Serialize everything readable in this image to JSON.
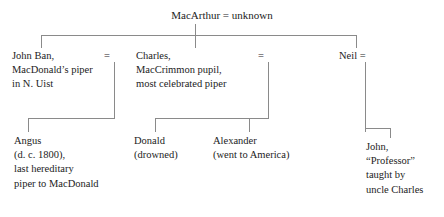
{
  "diagram": {
    "type": "family-tree",
    "line_color": "#8a8a8a",
    "background": "#ffffff",
    "marriage_symbol": "=",
    "root": {
      "label": "MacArthur = unknown",
      "person": "MacArthur",
      "spouse": "unknown"
    },
    "generation2": [
      {
        "name": "john-ban",
        "lines": [
          "John Ban,",
          "MacDonald’s piper",
          "in N. Uist"
        ],
        "marriage": "="
      },
      {
        "name": "charles",
        "lines": [
          "Charles,",
          "MacCrimmon pupil,",
          "most celebrated piper"
        ],
        "marriage": "="
      },
      {
        "name": "neil",
        "lines": [
          "Neil ="
        ],
        "marriage": "="
      }
    ],
    "generation3": [
      {
        "name": "angus",
        "lines": [
          "Angus",
          "(d. c. 1800),",
          "last hereditary",
          "piper to MacDonald"
        ]
      },
      {
        "name": "donald",
        "lines": [
          "Donald",
          "(drowned)"
        ]
      },
      {
        "name": "alexander",
        "lines": [
          "Alexander",
          "(went to America)"
        ]
      },
      {
        "name": "john-professor",
        "lines": [
          "John,",
          "“Professor”",
          "taught by",
          "uncle Charles"
        ]
      }
    ]
  }
}
